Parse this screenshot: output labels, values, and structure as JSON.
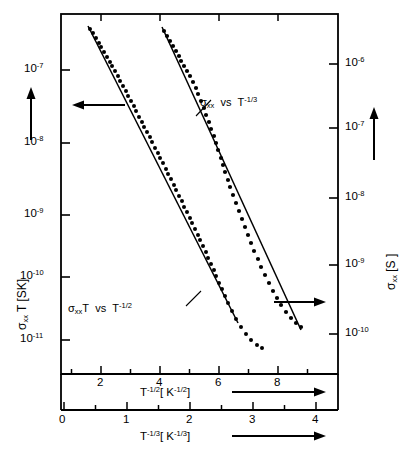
{
  "figure": {
    "kind": "scatter-with-fit-lines",
    "background": "#ffffff",
    "ink": "#000000"
  },
  "axes": {
    "left": {
      "name": "sigma-xx-T",
      "label_parts": {
        "sigma": "σ",
        "sub": "xx",
        "rest": " T  [SK]"
      },
      "label_plain": "σxx T  [SK]",
      "scale": "log",
      "ticks": [
        "10-7",
        "10-8",
        "10-9",
        "10-10",
        "10-11"
      ],
      "tick_mantissa": "10",
      "tick_exponents": [
        "-7",
        "-8",
        "-9",
        "-10",
        "-11"
      ],
      "arrow": "up-arrow"
    },
    "right": {
      "name": "sigma-xx",
      "label_parts": {
        "sigma": "σ",
        "sub": "xx",
        "rest": "  [S ]"
      },
      "label_plain": "σxx  [S ]",
      "scale": "log",
      "tick_mantissa": "10",
      "tick_exponents": [
        "-6",
        "-7",
        "-8",
        "-9",
        "-10"
      ],
      "arrow": "up-arrow"
    },
    "x_upper": {
      "name": "T-minus-one-half",
      "label_base": "T",
      "label_exp": "-1/2",
      "label_unit_open": "[ K",
      "label_unit_exp": "-1/2",
      "label_unit_close": "]",
      "label_plain": "T-1/2 [ K-1/2 ]",
      "ticks": [
        "2",
        "4",
        "6",
        "8"
      ],
      "minor_ticks_between": 1,
      "arrow": "right-arrow"
    },
    "x_lower": {
      "name": "T-minus-one-third",
      "label_base": "T",
      "label_exp": "-1/3",
      "label_unit_open": "[ K",
      "label_unit_exp": "-1/3",
      "label_unit_close": "]",
      "label_plain": "T-1/3 [ K-1/3 ]",
      "ticks": [
        "0",
        "1",
        "2",
        "3",
        "4"
      ],
      "minor_ticks_between": 1,
      "arrow": "right-arrow"
    }
  },
  "annotations": {
    "right_curve": {
      "sigma": "σ",
      "sub": "xx",
      "vs": "vs",
      "base": "T",
      "exp": "-1/3",
      "plain": "σxx  vs  T-1/3"
    },
    "left_curve": {
      "sigma": "σ",
      "sub": "xx",
      "tee": "T",
      "vs": "vs",
      "base": "T",
      "exp": "-1/2",
      "plain": "σxxT  vs  T-1/2"
    },
    "axis_pointer_left": "left-arrow",
    "axis_pointer_right": "right-arrow"
  },
  "chart_data": {
    "type": "scatter",
    "title": "",
    "xlabel": "T^-1/2 [K^-1/2]  /  T^-1/3 [K^-1/3]",
    "ylabel": "sigma_xx T [SK]  /  sigma_xx [S]",
    "grid": false,
    "legend_position": "inline-annotations",
    "axis_ranges": {
      "x_upper": [
        0.8,
        9.6
      ],
      "x_lower": [
        0.0,
        4.4
      ],
      "y_left_log10": [
        -6.55,
        -11.6
      ],
      "y_right_log10": [
        -5.5,
        -10.6
      ]
    },
    "series": [
      {
        "name": "sigma_xx T vs T^-1/2",
        "axis": "left",
        "x_axis": "x_upper",
        "marker": "filled-circle",
        "points_px": [
          [
            90,
            29
          ],
          [
            93,
            33
          ],
          [
            96,
            38
          ],
          [
            99,
            43
          ],
          [
            101,
            47
          ],
          [
            104,
            52
          ],
          [
            107,
            57
          ],
          [
            110,
            62
          ],
          [
            112,
            66
          ],
          [
            115,
            71
          ],
          [
            118,
            76
          ],
          [
            120,
            81
          ],
          [
            123,
            86
          ],
          [
            126,
            91
          ],
          [
            128,
            96
          ],
          [
            131,
            101
          ],
          [
            134,
            106
          ],
          [
            136,
            111
          ],
          [
            139,
            117
          ],
          [
            142,
            122
          ],
          [
            144,
            127
          ],
          [
            147,
            132
          ],
          [
            150,
            137
          ],
          [
            152,
            142
          ],
          [
            155,
            148
          ],
          [
            158,
            153
          ],
          [
            160,
            158
          ],
          [
            163,
            163
          ],
          [
            166,
            169
          ],
          [
            168,
            174
          ],
          [
            171,
            179
          ],
          [
            174,
            185
          ],
          [
            176,
            190
          ],
          [
            179,
            196
          ],
          [
            182,
            201
          ],
          [
            184,
            207
          ],
          [
            187,
            212
          ],
          [
            190,
            218
          ],
          [
            192,
            223
          ],
          [
            195,
            229
          ],
          [
            198,
            235
          ],
          [
            200,
            240
          ],
          [
            203,
            246
          ],
          [
            206,
            252
          ],
          [
            208,
            258
          ],
          [
            211,
            264
          ],
          [
            214,
            270
          ],
          [
            216,
            276
          ],
          [
            219,
            283
          ],
          [
            222,
            289
          ],
          [
            225,
            296
          ],
          [
            228,
            303
          ],
          [
            232,
            311
          ],
          [
            236,
            319
          ],
          [
            241,
            327
          ],
          [
            246,
            334
          ],
          [
            251,
            340
          ],
          [
            257,
            345
          ],
          [
            262,
            348
          ]
        ],
        "fit_line_px": [
          [
            88,
            26
          ],
          [
            238,
            323
          ]
        ]
      },
      {
        "name": "sigma_xx vs T^-1/3",
        "axis": "right",
        "x_axis": "x_lower",
        "marker": "filled-circle",
        "points_px": [
          [
            164,
            31
          ],
          [
            167,
            36
          ],
          [
            170,
            41
          ],
          [
            173,
            46
          ],
          [
            176,
            51
          ],
          [
            179,
            56
          ],
          [
            181,
            61
          ],
          [
            184,
            66
          ],
          [
            187,
            71
          ],
          [
            190,
            76
          ],
          [
            193,
            82
          ],
          [
            196,
            88
          ],
          [
            198,
            94
          ],
          [
            201,
            101
          ],
          [
            204,
            108
          ],
          [
            206,
            115
          ],
          [
            209,
            122
          ],
          [
            211,
            129
          ],
          [
            214,
            136
          ],
          [
            216,
            143
          ],
          [
            218,
            150
          ],
          [
            221,
            158
          ],
          [
            223,
            165
          ],
          [
            225,
            172
          ],
          [
            228,
            180
          ],
          [
            230,
            187
          ],
          [
            233,
            195
          ],
          [
            236,
            203
          ],
          [
            239,
            211
          ],
          [
            242,
            219
          ],
          [
            245,
            227
          ],
          [
            248,
            235
          ],
          [
            251,
            243
          ],
          [
            254,
            251
          ],
          [
            258,
            259
          ],
          [
            261,
            267
          ],
          [
            265,
            275
          ],
          [
            269,
            283
          ],
          [
            273,
            291
          ],
          [
            277,
            298
          ],
          [
            281,
            305
          ],
          [
            286,
            312
          ],
          [
            291,
            318
          ],
          [
            296,
            323
          ],
          [
            301,
            327
          ]
        ],
        "fit_line_px": [
          [
            162,
            27
          ],
          [
            301,
            330
          ]
        ]
      }
    ]
  }
}
